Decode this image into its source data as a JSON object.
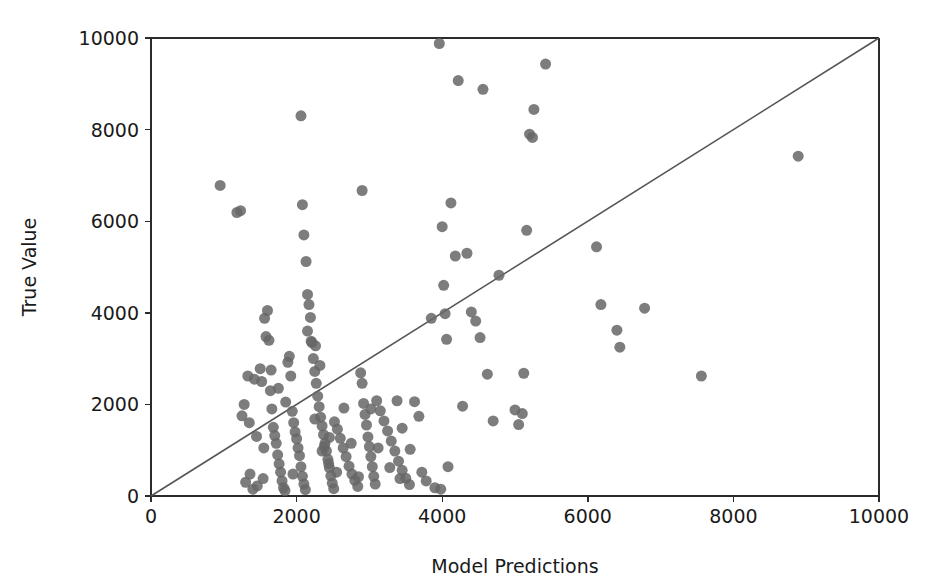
{
  "figure": {
    "background_color": "#ffffff",
    "width": 946,
    "height": 587
  },
  "chart_data": {
    "type": "scatter",
    "title": "",
    "xlabel": "Model Predictions",
    "ylabel": "True Value",
    "xlim": [
      0,
      10000
    ],
    "ylim": [
      0,
      10000
    ],
    "xticks": [
      0,
      2000,
      4000,
      6000,
      8000,
      10000
    ],
    "yticks": [
      0,
      2000,
      4000,
      6000,
      8000,
      10000
    ],
    "xtick_labels": [
      "0",
      "2000",
      "4000",
      "6000",
      "8000",
      "10000"
    ],
    "ytick_labels": [
      "0",
      "2000",
      "4000",
      "6000",
      "8000",
      "10000"
    ],
    "grid": false,
    "legend": null,
    "marker": {
      "shape": "circle",
      "color": "#666666",
      "size_px": 11,
      "alpha": 0.85
    },
    "reference_line": {
      "name": "identity-line",
      "description": "y = x diagonal reference line",
      "color": "#555555",
      "width_px": 1.6,
      "from": [
        0,
        0
      ],
      "to": [
        10000,
        10000
      ]
    },
    "series": [
      {
        "name": "predictions-vs-true",
        "points": [
          [
            950,
            6780
          ],
          [
            1180,
            6190
          ],
          [
            1230,
            6230
          ],
          [
            1280,
            2000
          ],
          [
            1330,
            2620
          ],
          [
            1420,
            2550
          ],
          [
            1500,
            2780
          ],
          [
            1520,
            2500
          ],
          [
            1560,
            3880
          ],
          [
            1580,
            3480
          ],
          [
            1600,
            4050
          ],
          [
            1620,
            3400
          ],
          [
            1640,
            2300
          ],
          [
            1660,
            1900
          ],
          [
            1680,
            1500
          ],
          [
            1700,
            1320
          ],
          [
            1720,
            1150
          ],
          [
            1740,
            900
          ],
          [
            1760,
            700
          ],
          [
            1780,
            520
          ],
          [
            1800,
            330
          ],
          [
            1820,
            180
          ],
          [
            1840,
            120
          ],
          [
            1300,
            300
          ],
          [
            1360,
            480
          ],
          [
            1400,
            150
          ],
          [
            1460,
            220
          ],
          [
            1540,
            380
          ],
          [
            1880,
            2920
          ],
          [
            1900,
            3050
          ],
          [
            1920,
            2620
          ],
          [
            1940,
            1850
          ],
          [
            1960,
            1600
          ],
          [
            1980,
            1400
          ],
          [
            2000,
            1250
          ],
          [
            2020,
            1050
          ],
          [
            2040,
            880
          ],
          [
            2060,
            640
          ],
          [
            2080,
            430
          ],
          [
            2100,
            260
          ],
          [
            2120,
            140
          ],
          [
            2060,
            8300
          ],
          [
            2080,
            6360
          ],
          [
            2100,
            5700
          ],
          [
            2130,
            5120
          ],
          [
            2150,
            4400
          ],
          [
            2170,
            4180
          ],
          [
            2190,
            3900
          ],
          [
            2210,
            3350
          ],
          [
            2230,
            3000
          ],
          [
            2250,
            2720
          ],
          [
            2270,
            2460
          ],
          [
            2290,
            2180
          ],
          [
            2310,
            1950
          ],
          [
            2330,
            1720
          ],
          [
            2350,
            1530
          ],
          [
            2370,
            1340
          ],
          [
            2390,
            1150
          ],
          [
            2410,
            980
          ],
          [
            2430,
            800
          ],
          [
            2450,
            620
          ],
          [
            2470,
            440
          ],
          [
            2490,
            280
          ],
          [
            2510,
            160
          ],
          [
            2200,
            3380
          ],
          [
            2260,
            3280
          ],
          [
            2320,
            2850
          ],
          [
            2380,
            1080
          ],
          [
            2440,
            710
          ],
          [
            2520,
            1620
          ],
          [
            2560,
            1460
          ],
          [
            2600,
            1260
          ],
          [
            2640,
            1050
          ],
          [
            2680,
            860
          ],
          [
            2720,
            650
          ],
          [
            2760,
            480
          ],
          [
            2800,
            340
          ],
          [
            2840,
            210
          ],
          [
            2880,
            2690
          ],
          [
            2900,
            2460
          ],
          [
            2920,
            2020
          ],
          [
            2940,
            1780
          ],
          [
            2960,
            1550
          ],
          [
            2980,
            1290
          ],
          [
            3000,
            1080
          ],
          [
            3020,
            860
          ],
          [
            3040,
            640
          ],
          [
            3060,
            430
          ],
          [
            3080,
            260
          ],
          [
            2900,
            6670
          ],
          [
            3020,
            1900
          ],
          [
            3100,
            2080
          ],
          [
            3150,
            1860
          ],
          [
            3200,
            1640
          ],
          [
            3250,
            1420
          ],
          [
            3300,
            1200
          ],
          [
            3350,
            980
          ],
          [
            3400,
            760
          ],
          [
            3450,
            560
          ],
          [
            3500,
            390
          ],
          [
            3550,
            250
          ],
          [
            3380,
            2080
          ],
          [
            3450,
            1480
          ],
          [
            3620,
            2060
          ],
          [
            3680,
            1740
          ],
          [
            3720,
            520
          ],
          [
            3780,
            330
          ],
          [
            3850,
            3880
          ],
          [
            3900,
            180
          ],
          [
            3960,
            9880
          ],
          [
            3980,
            150
          ],
          [
            4000,
            5880
          ],
          [
            4020,
            4600
          ],
          [
            4040,
            3980
          ],
          [
            4060,
            3420
          ],
          [
            4080,
            640
          ],
          [
            4120,
            6400
          ],
          [
            4180,
            5240
          ],
          [
            4220,
            9070
          ],
          [
            4280,
            1960
          ],
          [
            4340,
            5300
          ],
          [
            4400,
            4020
          ],
          [
            4460,
            3820
          ],
          [
            4520,
            3460
          ],
          [
            4560,
            8880
          ],
          [
            4620,
            2660
          ],
          [
            4700,
            1640
          ],
          [
            4780,
            4820
          ],
          [
            5000,
            1880
          ],
          [
            5050,
            1560
          ],
          [
            5100,
            1800
          ],
          [
            5120,
            2680
          ],
          [
            5160,
            5800
          ],
          [
            5200,
            7900
          ],
          [
            5240,
            7830
          ],
          [
            5260,
            8440
          ],
          [
            5420,
            9430
          ],
          [
            6120,
            5440
          ],
          [
            6180,
            4180
          ],
          [
            6400,
            3620
          ],
          [
            6440,
            3250
          ],
          [
            6780,
            4100
          ],
          [
            7560,
            2620
          ],
          [
            8890,
            7420
          ],
          [
            1250,
            1750
          ],
          [
            1350,
            1600
          ],
          [
            1450,
            1300
          ],
          [
            1550,
            1050
          ],
          [
            1650,
            2750
          ],
          [
            1750,
            2350
          ],
          [
            1850,
            2050
          ],
          [
            1950,
            480
          ],
          [
            2150,
            3600
          ],
          [
            2250,
            1680
          ],
          [
            2350,
            980
          ],
          [
            2450,
            1280
          ],
          [
            2550,
            520
          ],
          [
            2650,
            1920
          ],
          [
            2750,
            1150
          ],
          [
            2850,
            420
          ],
          [
            3120,
            1050
          ],
          [
            3280,
            620
          ],
          [
            3420,
            380
          ],
          [
            3560,
            1020
          ]
        ]
      }
    ]
  },
  "axes": {
    "plot_left_px": 151,
    "plot_top_px": 38,
    "plot_right_px": 879,
    "plot_bottom_px": 496,
    "spine_color": "#2b2b2b"
  }
}
